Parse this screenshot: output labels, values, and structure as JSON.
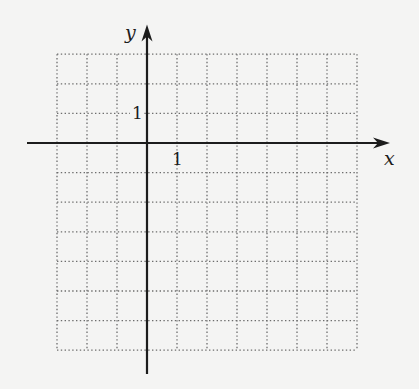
{
  "figure": {
    "x_axis": {
      "label": "x",
      "unit_tick_label": "1"
    },
    "y_axis": {
      "label": "y",
      "unit_tick_label": "1"
    },
    "grid": {
      "x_range": [
        -3,
        7
      ],
      "y_range": [
        -7,
        3
      ],
      "step": 1,
      "style": "dotted"
    },
    "axes_extent": {
      "x": [
        -4,
        8.1
      ],
      "y": [
        -7.8,
        4.0
      ]
    },
    "colors": {
      "background": "#f4f4f3",
      "axis": "#1c1c1c",
      "grid": "#6d6d6d"
    }
  }
}
